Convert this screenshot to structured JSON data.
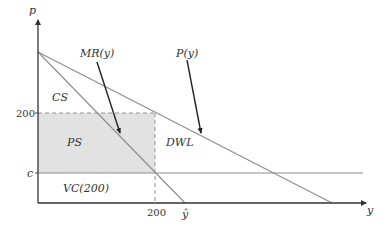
{
  "diagram": {
    "type": "monopoly-welfare",
    "axes": {
      "y_label": "p",
      "x_label": "y"
    },
    "ticks": {
      "y_200": "200",
      "y_c": "c",
      "x_200": "200",
      "x_yhat": "ŷ"
    },
    "curves": {
      "marginal_revenue": "MR(y)",
      "price": "P(y)"
    },
    "regions": {
      "consumer_surplus": "CS",
      "producer_surplus": "PS",
      "deadweight_loss": "DWL",
      "variable_cost": "VC(200)"
    },
    "colors": {
      "axis": "#333333",
      "curve": "#8c8c8c",
      "arrow": "#222222",
      "shade": "#e2e2e2",
      "dash": "#888888"
    }
  }
}
